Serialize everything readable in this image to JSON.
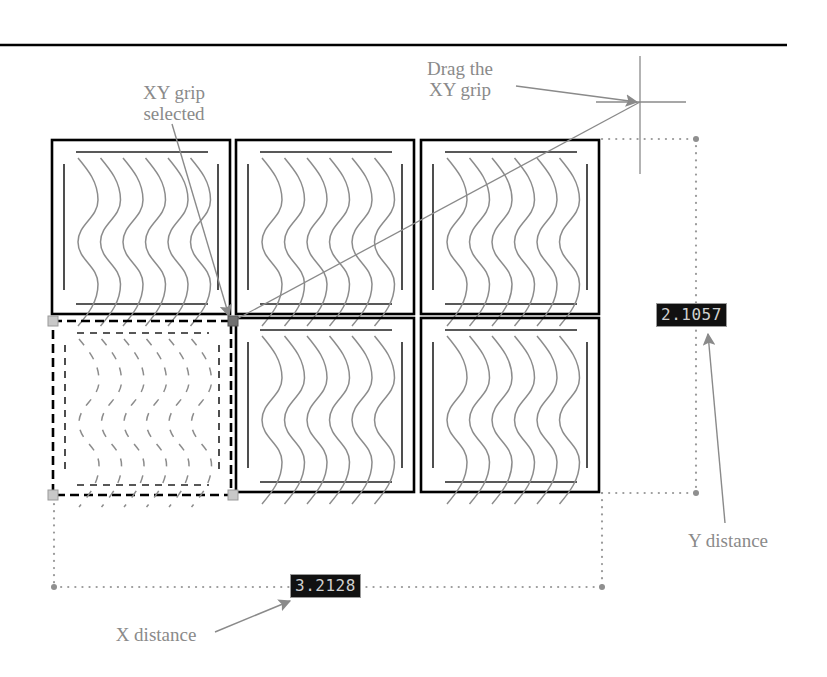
{
  "figure": {
    "callouts": {
      "xy_grip_selected": "XY grip\nselected",
      "xy_grip_selected_line1": "XY grip",
      "xy_grip_selected_line2": "selected",
      "drag_line1": "Drag the",
      "drag_line2": "XY grip",
      "x_distance": "X distance",
      "y_distance": "Y distance"
    },
    "dimensions": {
      "x_value": "3.2128",
      "y_value": "2.1057"
    },
    "grid": {
      "rows": 2,
      "columns": 3,
      "selected_cell": "row 2, column 1",
      "waves_per_cell": 6
    },
    "colors": {
      "tile_outline": "#000000",
      "wave": "#8c8c8c",
      "leader": "#8a8a8a",
      "dotted_dimension": "#9a9a9a",
      "grip_unselected": "#c8c8c8",
      "grip_selected": "#707070",
      "dim_box_bg": "#111111",
      "dim_box_text": "#cfcfcf"
    }
  }
}
